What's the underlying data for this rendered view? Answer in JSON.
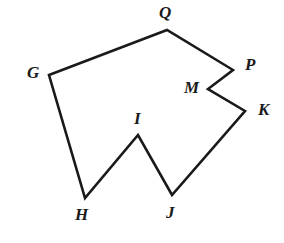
{
  "figure": {
    "type": "geometry-polygon-diagram",
    "background_color": "#FFFFFF",
    "stroke_color": "#1A1A1A",
    "stroke_width": 2.6,
    "label_color": "#1A1A1A",
    "fill": "none",
    "width": 284,
    "height": 243,
    "closed": true
  },
  "polygon": {
    "name": "GQPMKJIH",
    "vertex_order": [
      "G",
      "Q",
      "P",
      "M",
      "K",
      "J",
      "I",
      "H"
    ],
    "vertices": [
      {
        "id": "G",
        "label": "G",
        "x": 49,
        "y": 75,
        "label_x": 27,
        "label_y": 64,
        "convex": true
      },
      {
        "id": "Q",
        "label": "Q",
        "x": 167,
        "y": 30,
        "label_x": 159,
        "label_y": 4,
        "convex": true
      },
      {
        "id": "P",
        "label": "P",
        "x": 233,
        "y": 70,
        "label_x": 245,
        "label_y": 56,
        "convex": true
      },
      {
        "id": "M",
        "label": "M",
        "x": 208,
        "y": 89,
        "label_x": 184,
        "label_y": 79,
        "convex": false
      },
      {
        "id": "K",
        "label": "K",
        "x": 245,
        "y": 111,
        "label_x": 258,
        "label_y": 101,
        "convex": true
      },
      {
        "id": "J",
        "label": "J",
        "x": 172,
        "y": 195,
        "label_x": 166,
        "label_y": 204,
        "convex": true
      },
      {
        "id": "I",
        "label": "I",
        "x": 138,
        "y": 135,
        "label_x": 134,
        "label_y": 110,
        "convex": false
      },
      {
        "id": "H",
        "label": "H",
        "x": 85,
        "y": 198,
        "label_x": 75,
        "label_y": 206,
        "convex": true
      }
    ],
    "edges": [
      {
        "from": "G",
        "to": "Q"
      },
      {
        "from": "Q",
        "to": "P"
      },
      {
        "from": "P",
        "to": "M"
      },
      {
        "from": "M",
        "to": "K"
      },
      {
        "from": "K",
        "to": "J"
      },
      {
        "from": "J",
        "to": "I"
      },
      {
        "from": "I",
        "to": "H"
      },
      {
        "from": "H",
        "to": "G"
      }
    ],
    "path_d": "M 49 75 L 167 30 L 233 70 L 208 89 L 245 111 L 172 195 L 138 135 L 85 198 Z"
  }
}
